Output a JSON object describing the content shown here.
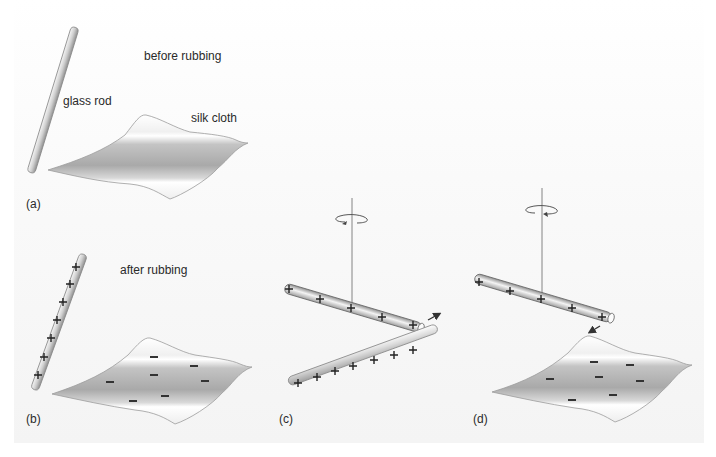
{
  "figure": {
    "panels": [
      {
        "id": "a",
        "label": "(a)",
        "caption": "before rubbing",
        "items": {
          "rod": "glass rod",
          "cloth": "silk cloth"
        }
      },
      {
        "id": "b",
        "label": "(b)",
        "caption": "after rubbing",
        "rod_charge": "+",
        "rod_charge_count": 7,
        "cloth_charge": "−",
        "cloth_charge_count": 7
      },
      {
        "id": "c",
        "label": "(c)",
        "suspended_rod_charge_count": 5,
        "held_rod_charge_count": 7,
        "interaction": "repel"
      },
      {
        "id": "d",
        "label": "(d)",
        "suspended_rod_charge_count": 5,
        "cloth_charge_count": 7,
        "interaction": "attract"
      }
    ]
  },
  "colors": {
    "rod_fill": "#c9c9c9",
    "cloth_fill": "#b5b5b5",
    "charge_mark": "#222222",
    "string": "#777777"
  }
}
